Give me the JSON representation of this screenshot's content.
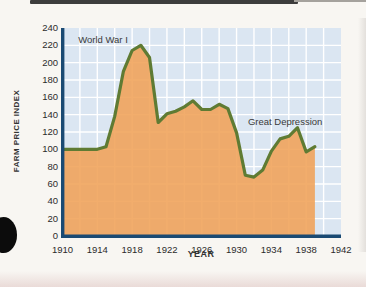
{
  "chart_data": {
    "type": "area",
    "title": "",
    "xlabel": "YEAR",
    "ylabel": "FARM PRICE INDEX",
    "xlim": [
      1910,
      1942
    ],
    "ylim": [
      0,
      240
    ],
    "x_grid_step": 2,
    "y_tick_step": 20,
    "x_tick_labels": [
      1910,
      1914,
      1918,
      1922,
      1926,
      1930,
      1934,
      1938,
      1942
    ],
    "y_tick_labels": [
      0,
      20,
      40,
      60,
      80,
      100,
      120,
      140,
      160,
      180,
      200,
      220,
      240
    ],
    "grid": true,
    "legend": "none",
    "x": [
      1910,
      1911,
      1912,
      1913,
      1914,
      1915,
      1916,
      1917,
      1918,
      1919,
      1920,
      1921,
      1922,
      1923,
      1924,
      1925,
      1926,
      1927,
      1928,
      1929,
      1930,
      1931,
      1932,
      1933,
      1934,
      1935,
      1936,
      1937,
      1938,
      1939
    ],
    "series": [
      {
        "name": "Farm Price Index",
        "values": [
          100,
          100,
          100,
          100,
          100,
          103,
          138,
          190,
          214,
          220,
          206,
          131,
          141,
          144,
          149,
          156,
          146,
          146,
          152,
          147,
          119,
          70,
          68,
          76,
          98,
          112,
          115,
          125,
          97,
          103
        ]
      }
    ],
    "annotations": [
      {
        "text": "World War I",
        "x": 1911.8,
        "y": 226
      },
      {
        "text": "Great Depression",
        "x": 1931.3,
        "y": 131
      }
    ],
    "colors": {
      "panel": "#dbe6f2",
      "grid": "#ffffff",
      "fill": "#f0a156",
      "line": "#5f7b33",
      "axis": "#1a4a73",
      "text": "#2b2b2b"
    }
  },
  "decor": {
    "top_bar_color": "#3d3d3d",
    "punch_hole_color": "#0c0c0c",
    "page_background": "#f8f6f2"
  }
}
